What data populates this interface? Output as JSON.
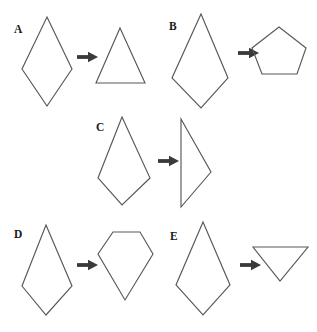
{
  "figure": {
    "background_color": "#ffffff",
    "stroke_color": "#585858",
    "arrow_color": "#3a3a3a",
    "label_color": "#1a1a1a",
    "width": 317,
    "height": 332,
    "arrow_icon_name": "right-arrow-icon",
    "items": [
      {
        "label": "A",
        "label_x": 14,
        "label_y": 33,
        "source_name": "kite-shape",
        "source_points": "47,17 72,69 47,106 22,69",
        "arrow_x": 77,
        "arrow_y": 57,
        "result_name": "triangle-shape",
        "result_points": "120,28 145,83 96,83"
      },
      {
        "label": "B",
        "label_x": 169,
        "label_y": 30,
        "source_name": "kite-shape",
        "source_points": "201,14 228,78 201,108 172,78",
        "arrow_x": 238,
        "arrow_y": 53,
        "result_name": "pentagon-shape",
        "result_points": "279,27 306,48 297,74 262,74 252,48"
      },
      {
        "label": "C",
        "label_x": 96,
        "label_y": 131,
        "source_name": "kite-shape",
        "source_points": "122,117 150,178 122,205 98,178",
        "arrow_x": 158,
        "arrow_y": 161,
        "result_name": "narrow-kite-shape",
        "result_points": "181,119 211,172 181,207 181,119"
      },
      {
        "label": "D",
        "label_x": 14,
        "label_y": 238,
        "source_name": "kite-shape",
        "source_points": "46,225 72,286 46,315 22,286",
        "arrow_x": 77,
        "arrow_y": 265,
        "result_name": "pentagon-shape",
        "result_points": "113,232 140,232 153,254 125,300 98,254"
      },
      {
        "label": "E",
        "label_x": 170,
        "label_y": 240,
        "source_name": "kite-shape",
        "source_points": "203,222 230,285 203,315 176,285",
        "arrow_x": 240,
        "arrow_y": 265,
        "result_name": "inverted-triangle-shape",
        "result_points": "253,247 308,247 280,281"
      }
    ]
  }
}
